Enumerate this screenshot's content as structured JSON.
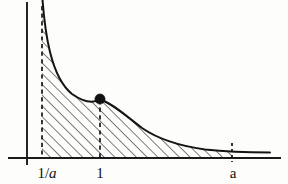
{
  "figure": {
    "background_color": "#fdfdfc",
    "ink_color": "#141414"
  },
  "axes": {
    "y_axis": {
      "name": "y-axis",
      "x": 27,
      "y_top": 2,
      "y_bottom": 165
    },
    "x_axis": {
      "name": "x-axis",
      "y": 158,
      "x_left": 8,
      "x_right": 281
    }
  },
  "curve": {
    "name": "reciprocal-curve",
    "equation": "y = 1/x",
    "path": "M 42.5 0 C 43.6 14 45.5 34 50 52 C 55 72 62 86 72 94 C 82 101 92 104 100 99.5 C 112 103 126 116 142 128 C 158 139 180 146 205 149.5 C 228 152 252 152.5 270 152.5",
    "start_point": [
      42.5,
      0
    ],
    "end_point": [
      270,
      152.5
    ]
  },
  "guides": [
    {
      "name": "dashed-guide-lower-bound",
      "label": "1/a",
      "x": 42,
      "y_top": 6,
      "y_bottom": 158
    },
    {
      "name": "dashed-guide-unit",
      "label": "1",
      "x": 100,
      "y_top": 100,
      "y_bottom": 158
    },
    {
      "name": "dashed-guide-upper-bound",
      "label": "a",
      "x": 232,
      "y_top": 143,
      "y_bottom": 158
    }
  ],
  "marker": {
    "name": "point-on-curve",
    "x": 100,
    "y": 99,
    "radius": 5.1,
    "shape": "filled-circle"
  },
  "shading": {
    "name": "hatched-area",
    "style": "diagonal-hatching",
    "angle_degrees": 45,
    "spacing_px": 7.6,
    "x_from": 42,
    "x_to": 232
  },
  "labels": {
    "lower_bound": {
      "text_numerator": "1/",
      "text_italic": "a",
      "full": "1/a",
      "x": 47,
      "y": 178
    },
    "unit": {
      "text": "1",
      "x": 100,
      "y": 178
    },
    "upper_bound": {
      "text_italic": "a",
      "full": "a",
      "x": 233,
      "y": 178
    }
  },
  "chart_data": {
    "type": "line",
    "title": "",
    "xlabel": "",
    "ylabel": "",
    "function": "y = 1/x",
    "grid": false,
    "legend": null,
    "x_tick_labels": [
      "1/a",
      "1",
      "a"
    ],
    "x_tick_pixels": [
      42,
      100,
      232
    ],
    "y_tick_labels": [],
    "annotations": [
      {
        "text": "filled dot at (1, 1) on the curve",
        "x_label": "1",
        "pixel": [
          100,
          99
        ]
      },
      {
        "text": "region under y = 1/x from 1/a to a is hatched",
        "x_from_label": "1/a",
        "x_to_label": "a"
      }
    ],
    "series": [
      {
        "name": "y = 1/x",
        "x": [
          0.2,
          0.25,
          0.3,
          0.4,
          0.5,
          0.65,
          0.8,
          1.0,
          1.3,
          1.6,
          2.0,
          2.5,
          3.0,
          3.5
        ],
        "y": [
          5.0,
          4.0,
          3.33,
          2.5,
          2.0,
          1.54,
          1.25,
          1.0,
          0.77,
          0.63,
          0.5,
          0.4,
          0.33,
          0.29
        ]
      }
    ]
  }
}
